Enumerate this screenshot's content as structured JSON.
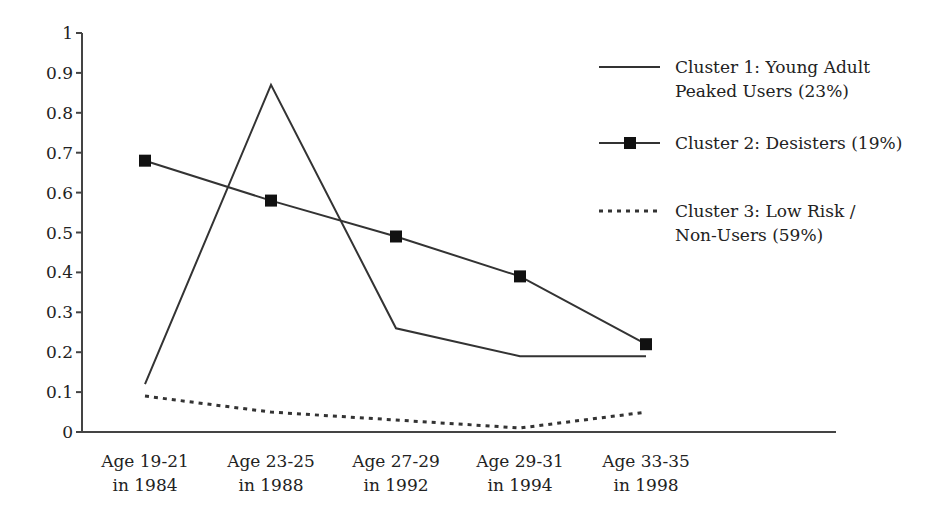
{
  "chart_data": {
    "type": "line",
    "title": "",
    "xlabel": "",
    "ylabel": "",
    "ylim": [
      0,
      1
    ],
    "yticks": [
      "0",
      "0.1",
      "0.2",
      "0.3",
      "0.4",
      "0.5",
      "0.6",
      "0.7",
      "0.8",
      "0.9",
      "1"
    ],
    "grid": false,
    "legend_position": "right",
    "categories": [
      [
        "Age 19-21",
        "in 1984"
      ],
      [
        "Age 23-25",
        "in 1988"
      ],
      [
        "Age 27-29",
        "in 1992"
      ],
      [
        "Age 29-31",
        "in 1994"
      ],
      [
        "Age 33-35",
        "in 1998"
      ]
    ],
    "series": [
      {
        "name": "Cluster 1: Young Adult Peaked Users (23%)",
        "legend_lines": [
          "Cluster 1: Young Adult",
          "Peaked Users (23%)"
        ],
        "style": "solid",
        "marker": "none",
        "values": [
          0.12,
          0.87,
          0.26,
          0.19,
          0.19
        ]
      },
      {
        "name": "Cluster 2: Desisters (19%)",
        "legend_lines": [
          "Cluster 2: Desisters (19%)"
        ],
        "style": "solid",
        "marker": "square",
        "values": [
          0.68,
          0.58,
          0.49,
          0.39,
          0.22
        ]
      },
      {
        "name": "Cluster 3: Low Risk / Non-Users (59%)",
        "legend_lines": [
          "Cluster 3: Low Risk /",
          "Non-Users (59%)"
        ],
        "style": "dotted",
        "marker": "none",
        "values": [
          0.09,
          0.05,
          0.03,
          0.01,
          0.05
        ]
      }
    ]
  },
  "colors": {
    "line": "#333333",
    "axis": "#444444",
    "marker": "#111111",
    "text": "#222222"
  }
}
